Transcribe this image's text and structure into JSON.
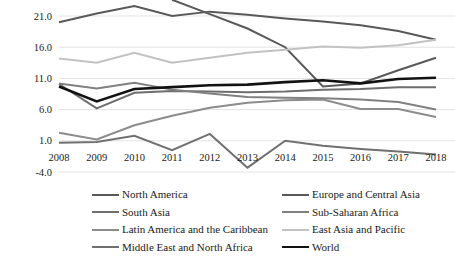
{
  "chart_data": {
    "type": "line",
    "title": "",
    "subtitle": "",
    "xlabel": "",
    "ylabel": "",
    "x": [
      2008,
      2009,
      2010,
      2011,
      2012,
      2013,
      2014,
      2015,
      2016,
      2017,
      2018
    ],
    "categories": [
      "2008",
      "2009",
      "2010",
      "2011",
      "2012",
      "2013",
      "2014",
      "2015",
      "2016",
      "2017",
      "2018"
    ],
    "ylim": [
      -4.0,
      24.0
    ],
    "yticks": [
      -4.0,
      1.0,
      6.0,
      11.0,
      16.0,
      21.0
    ],
    "ytick_labels": [
      "-4.0",
      "1.0",
      "6.0",
      "11.0",
      "16.0",
      "21.0"
    ],
    "grid": true,
    "legend_position": "bottom",
    "series": [
      {
        "name": "North America",
        "color": "#595959",
        "width": 2.0,
        "values": [
          20.0,
          21.4,
          22.6,
          21.0,
          21.7,
          21.2,
          20.6,
          20.1,
          19.5,
          18.6,
          17.2
        ]
      },
      {
        "name": "Europe and Central Asia",
        "color": "#595959",
        "width": 2.0,
        "values": [
          null,
          null,
          null,
          23.6,
          21.3,
          19.0,
          16.0,
          9.7,
          10.2,
          12.3,
          14.3
        ]
      },
      {
        "name": "South Asia",
        "color": "#6e6e6e",
        "width": 2.0,
        "values": [
          10.1,
          6.2,
          8.7,
          9.0,
          8.9,
          8.8,
          8.9,
          9.2,
          9.3,
          9.6,
          9.6
        ]
      },
      {
        "name": "Sub-Saharan Africa",
        "color": "#808080",
        "width": 2.0,
        "values": [
          10.2,
          9.4,
          10.3,
          9.2,
          8.6,
          8.0,
          7.9,
          7.8,
          7.6,
          7.2,
          6.0
        ]
      },
      {
        "name": "Latin America and the Caribbean",
        "color": "#8c8c8c",
        "width": 2.0,
        "values": [
          2.3,
          1.2,
          3.5,
          5.0,
          6.3,
          7.1,
          7.5,
          7.6,
          6.1,
          6.1,
          4.8
        ]
      },
      {
        "name": "East Asia and Pacific",
        "color": "#c2c2c2",
        "width": 2.0,
        "values": [
          14.2,
          13.5,
          15.1,
          13.5,
          14.3,
          15.1,
          15.6,
          16.1,
          15.9,
          16.3,
          17.2
        ]
      },
      {
        "name": "Middle East and North Africa",
        "color": "#707070",
        "width": 2.0,
        "values": [
          0.7,
          0.8,
          1.8,
          -0.5,
          2.1,
          -3.3,
          1.0,
          0.2,
          -0.3,
          -0.7,
          -1.2
        ]
      },
      {
        "name": "World",
        "color": "#121212",
        "width": 2.6,
        "values": [
          9.7,
          7.3,
          9.3,
          9.6,
          9.9,
          10.0,
          10.4,
          10.7,
          10.2,
          10.9,
          11.1
        ]
      }
    ]
  }
}
